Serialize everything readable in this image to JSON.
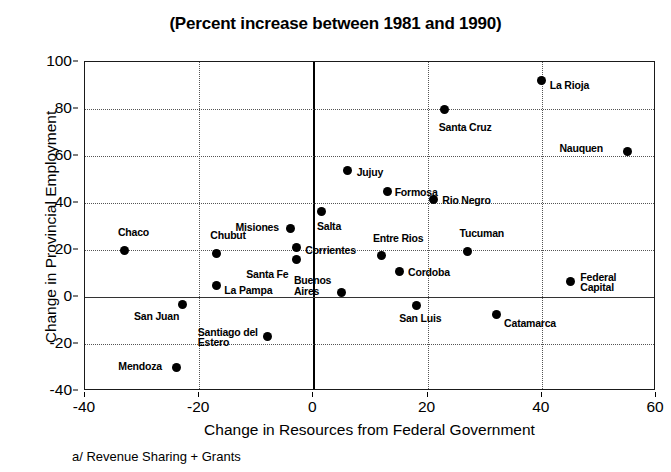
{
  "chart_data": {
    "type": "scatter",
    "title": "(Percent increase between 1981 and 1990)",
    "xlabel": "Change in Resources from Federal Government",
    "ylabel": "Change in Provincial Employment",
    "footnote": "a/ Revenue Sharing + Grants",
    "xlim": [
      -40,
      60
    ],
    "ylim": [
      -40,
      100
    ],
    "xticks": [
      -40,
      -20,
      0,
      20,
      40,
      60
    ],
    "yticks": [
      -40,
      -20,
      0,
      20,
      40,
      60,
      80,
      100
    ],
    "xtick_labels": [
      "-40",
      "-20",
      "0",
      "20",
      "40",
      "60"
    ],
    "ytick_labels": [
      "-40",
      "-20",
      "0",
      "20",
      "40",
      "60",
      "80",
      "100"
    ],
    "grid": true,
    "legend": "none",
    "points": [
      {
        "label": "La Rioja",
        "x": 40,
        "y": 92,
        "lx": 8,
        "ly": 4
      },
      {
        "label": "Santa Cruz",
        "x": 23,
        "y": 80,
        "lx": -6,
        "ly": 18
      },
      {
        "label": "Nauquen",
        "x": 55,
        "y": 62,
        "lx": -68,
        "ly": -3
      },
      {
        "label": "Jujuy",
        "x": 6,
        "y": 54,
        "lx": 9,
        "ly": 2
      },
      {
        "label": "Formosa",
        "x": 13,
        "y": 45,
        "lx": 7,
        "ly": 1
      },
      {
        "label": "Rio Negro",
        "x": 21,
        "y": 41.5,
        "lx": 9,
        "ly": 1
      },
      {
        "label": "Salta",
        "x": 1.5,
        "y": 36.5,
        "lx": -5,
        "ly": 15
      },
      {
        "label": "Misiones",
        "x": -4,
        "y": 29,
        "lx": -55,
        "ly": -2
      },
      {
        "label": "Corrientes",
        "x": -3,
        "y": 21,
        "lx": 9,
        "ly": 2
      },
      {
        "label": "Chaco",
        "x": -33,
        "y": 20,
        "lx": -7,
        "ly": -18
      },
      {
        "label": "Tucuman",
        "x": 27,
        "y": 19.5,
        "lx": -8,
        "ly": -18
      },
      {
        "label": "Chubut",
        "x": -17,
        "y": 18.5,
        "lx": -6,
        "ly": -19
      },
      {
        "label": "Entre Rios",
        "x": 12,
        "y": 17.5,
        "lx": -9,
        "ly": -18
      },
      {
        "label": "Santa Fe",
        "x": -3,
        "y": 16,
        "lx": -50,
        "ly": 15
      },
      {
        "label": "Cordoba",
        "x": 15,
        "y": 11,
        "lx": 9,
        "ly": 1
      },
      {
        "label": "Federal\nCapital",
        "x": 45,
        "y": 6.5,
        "lx": 10,
        "ly": -5
      },
      {
        "label": "La Pampa",
        "x": -17,
        "y": 5,
        "lx": 8,
        "ly": 5
      },
      {
        "label": "Buenos\nAires",
        "x": 5,
        "y": 2,
        "lx": -48,
        "ly": -12
      },
      {
        "label": "San Juan",
        "x": -23,
        "y": -3,
        "lx": -48,
        "ly": 12
      },
      {
        "label": "San Luis",
        "x": 18,
        "y": -3.5,
        "lx": -17,
        "ly": 13
      },
      {
        "label": "Catamarca",
        "x": 32,
        "y": -7.5,
        "lx": 8,
        "ly": 8
      },
      {
        "label": "Santiago del\nEstero",
        "x": -8,
        "y": -17,
        "lx": -70,
        "ly": -5
      },
      {
        "label": "Mendoza",
        "x": -24,
        "y": -30,
        "lx": -58,
        "ly": -2
      }
    ]
  }
}
